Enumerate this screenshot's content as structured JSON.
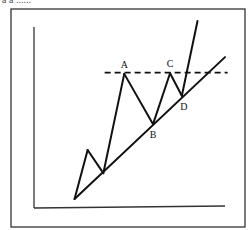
{
  "caption_fragment": "a a ......",
  "chart_data": {
    "type": "line",
    "title": "",
    "xlabel": "",
    "ylabel": "",
    "price_path": [
      {
        "x": 0,
        "y": 0
      },
      {
        "x": 1,
        "y": 3.8
      },
      {
        "x": 2.2,
        "y": 2
      },
      {
        "x": 3.8,
        "y": 9.7,
        "label": "A"
      },
      {
        "x": 6,
        "y": 5.8,
        "label": "B"
      },
      {
        "x": 7.3,
        "y": 9.75,
        "label": "C"
      },
      {
        "x": 8.2,
        "y": 8.0,
        "label": "D"
      },
      {
        "x": 9.4,
        "y": 13.8
      }
    ],
    "support_trendline": [
      {
        "x": 0,
        "y": 0
      },
      {
        "x": 11.5,
        "y": 11
      }
    ],
    "resistance_level": {
      "y": 9.8,
      "style": "dashed",
      "x_from": 2.3,
      "x_to": 11.7
    },
    "point_labels": [
      "A",
      "B",
      "C",
      "D"
    ],
    "xlim": [
      -3.1,
      11.5
    ],
    "ylim": [
      -0.7,
      13.8
    ],
    "grid": false
  }
}
